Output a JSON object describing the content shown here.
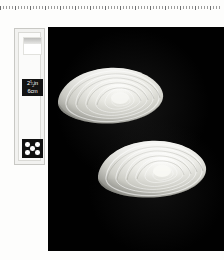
{
  "page": {
    "background_color": "#fdfdfc",
    "width": 224,
    "height": 260
  },
  "ruler": {
    "name": "ruler-edge",
    "tick_count": 74,
    "tick_color": "#9b9b9b"
  },
  "plate": {
    "label": "Specimen plate",
    "background_color": "#010101"
  },
  "specimens": [
    {
      "name": "bivalve-shell-upper",
      "label": "Bivalve shell, upper specimen",
      "growth_rings": 7,
      "shell_color": "#e9e9e4"
    },
    {
      "name": "bivalve-shell-lower",
      "label": "Bivalve shell, lower specimen",
      "growth_rings": 7,
      "shell_color": "#ececE7"
    }
  ],
  "scale_card": {
    "label": "Scale reference card",
    "white_swatch_label": "White balance swatch",
    "measure": {
      "imperial_whole": "2",
      "imperial_fraction_numerator": "1",
      "imperial_fraction_denominator": "2",
      "imperial_unit": "in",
      "metric": "6cm"
    },
    "dot_block": {
      "label": "Five dot registration pattern",
      "dot_count": 5,
      "background_color": "#111111",
      "dot_color": "#ffffff"
    }
  }
}
